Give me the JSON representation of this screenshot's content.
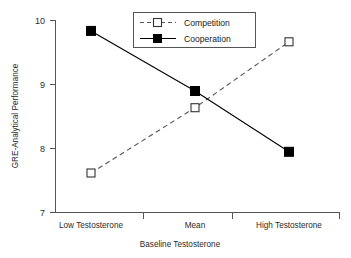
{
  "chart_data": {
    "type": "line",
    "title": "",
    "xlabel": "Baseline Testosterone",
    "ylabel": "GRE-Analytical Performance",
    "categories": [
      "Low Testosterone",
      "Mean",
      "High Testosterone"
    ],
    "ylim": [
      7,
      10
    ],
    "yticks": [
      "7",
      "8",
      "9",
      "10"
    ],
    "ytick_values": [
      7,
      8,
      9,
      10
    ],
    "grid": false,
    "legend_position": "top-center",
    "series": [
      {
        "name": "Competition",
        "values": [
          7.61,
          8.63,
          9.66
        ],
        "marker": "open-square",
        "linestyle": "dashed",
        "color": "#555555"
      },
      {
        "name": "Cooperation",
        "values": [
          9.83,
          8.89,
          7.94
        ],
        "marker": "filled-square",
        "linestyle": "solid",
        "color": "#000000"
      }
    ]
  },
  "axes": {
    "y_tick_0": "7",
    "y_tick_1": "8",
    "y_tick_2": "9",
    "y_tick_3": "10",
    "x_cat_0": "Low Testosterone",
    "x_cat_1": "Mean",
    "x_cat_2": "High Testosterone",
    "x_axis_title": "Baseline Testosterone",
    "y_axis_title": "GRE-Analytical Performance"
  },
  "legend": {
    "entry_0": "Competition",
    "entry_1": "Cooperation"
  }
}
